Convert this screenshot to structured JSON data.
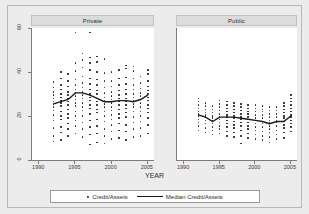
{
  "figure": {
    "background_color": "#ececed",
    "plot_background_color": "#ffffff",
    "marker_color": "#1b1b1b",
    "median_line_color": "#1a1a1a"
  },
  "panels": [
    {
      "title": "Private"
    },
    {
      "title": "Public"
    }
  ],
  "axis": {
    "x_title": "YEAR",
    "y_ticks": [
      "60",
      "40",
      "20",
      "0"
    ],
    "x_ticks_left": [
      "1990",
      "1995",
      "2000",
      "2005"
    ],
    "x_ticks_right": [
      "1990",
      "1995",
      "2000",
      "2005"
    ]
  },
  "legend": {
    "scatter_label": "Credit/Assets",
    "median_label": "Median Credit/Assets"
  },
  "chart_data": {
    "type": "scatter",
    "title": "",
    "xlabel": "YEAR",
    "ylabel": "",
    "xlim": [
      1989,
      2006
    ],
    "ylim": [
      0,
      60
    ],
    "y_ticks": [
      0,
      20,
      40,
      60
    ],
    "x_ticks": [
      1990,
      1995,
      2000,
      2005
    ],
    "grid": false,
    "legend_position": "bottom",
    "panels": [
      {
        "name": "Private",
        "series": [
          {
            "name": "Credit/Assets",
            "type": "scatter",
            "points": [
              {
                "x": 1992,
                "values": [
                  8.5,
                  11.0,
                  14.5,
                  18.0,
                  20.5,
                  22.5,
                  24.0,
                  25.5,
                  26.5,
                  28.0,
                  29.5,
                  31.0,
                  33.0,
                  35.5
                ]
              },
              {
                "x": 1993,
                "values": [
                  9.0,
                  12.5,
                  15.0,
                  18.5,
                  20.0,
                  22.0,
                  24.5,
                  26.0,
                  27.0,
                  28.5,
                  30.0,
                  32.0,
                  34.0,
                  37.0,
                  40.0
                ]
              },
              {
                "x": 1994,
                "values": [
                  11.0,
                  14.0,
                  16.5,
                  19.0,
                  21.0,
                  23.0,
                  25.0,
                  26.5,
                  28.0,
                  29.5,
                  31.0,
                  33.5,
                  36.0,
                  39.0
                ]
              },
              {
                "x": 1995,
                "values": [
                  12.0,
                  15.5,
                  18.0,
                  20.0,
                  22.0,
                  24.5,
                  26.0,
                  27.5,
                  29.0,
                  30.5,
                  32.0,
                  34.0,
                  36.5,
                  40.5,
                  44.0,
                  58.0
                ]
              },
              {
                "x": 1996,
                "values": [
                  10.5,
                  14.0,
                  17.0,
                  20.0,
                  22.5,
                  24.0,
                  26.0,
                  28.0,
                  29.5,
                  31.0,
                  33.0,
                  35.0,
                  38.0,
                  42.0,
                  45.5,
                  48.5
                ]
              },
              {
                "x": 1997,
                "values": [
                  7.0,
                  11.5,
                  15.0,
                  18.0,
                  21.0,
                  23.5,
                  25.0,
                  27.0,
                  28.5,
                  30.0,
                  32.0,
                  34.5,
                  37.0,
                  41.0,
                  44.0,
                  46.5,
                  58.0
                ]
              },
              {
                "x": 1998,
                "values": [
                  8.0,
                  12.0,
                  15.5,
                  18.5,
                  21.5,
                  23.0,
                  25.0,
                  26.5,
                  28.0,
                  30.0,
                  31.5,
                  34.0,
                  36.5,
                  40.0,
                  44.5,
                  47.0
                ]
              },
              {
                "x": 1999,
                "values": [
                  7.5,
                  11.0,
                  14.0,
                  17.5,
                  20.0,
                  22.0,
                  24.0,
                  25.5,
                  27.0,
                  28.5,
                  30.5,
                  33.0,
                  36.0,
                  39.5,
                  46.0
                ]
              },
              {
                "x": 2000,
                "values": [
                  9.5,
                  13.0,
                  16.0,
                  18.5,
                  20.5,
                  22.5,
                  24.0,
                  26.0,
                  27.5,
                  29.0,
                  31.0,
                  33.5,
                  36.0,
                  40.0
                ]
              },
              {
                "x": 2001,
                "values": [
                  10.0,
                  13.5,
                  16.5,
                  19.0,
                  21.0,
                  23.0,
                  25.0,
                  26.5,
                  28.0,
                  29.5,
                  31.5,
                  34.0,
                  37.0,
                  41.0
                ]
              },
              {
                "x": 2002,
                "values": [
                  9.0,
                  13.0,
                  16.0,
                  19.5,
                  21.5,
                  23.5,
                  25.0,
                  26.5,
                  28.0,
                  30.0,
                  32.0,
                  34.5,
                  37.5,
                  41.5,
                  43.0
                ]
              },
              {
                "x": 2003,
                "values": [
                  10.5,
                  14.0,
                  17.0,
                  19.5,
                  22.0,
                  24.0,
                  25.5,
                  27.0,
                  28.5,
                  30.0,
                  32.0,
                  34.0,
                  37.0,
                  40.5,
                  42.5
                ]
              },
              {
                "x": 2004,
                "values": [
                  11.0,
                  14.5,
                  17.5,
                  20.0,
                  22.0,
                  24.0,
                  26.0,
                  27.5,
                  29.0,
                  30.5,
                  32.5,
                  35.0,
                  38.0
                ]
              },
              {
                "x": 2005,
                "values": [
                  12.0,
                  16.0,
                  19.0,
                  21.5,
                  23.5,
                  25.0,
                  27.0,
                  28.5,
                  30.0,
                  31.5,
                  33.5,
                  36.0,
                  39.0,
                  41.0
                ]
              }
            ]
          },
          {
            "name": "Median Credit/Assets",
            "type": "line",
            "x": [
              1992,
              1993,
              1994,
              1995,
              1996,
              1997,
              1998,
              1999,
              2000,
              2001,
              2002,
              2003,
              2004,
              2005
            ],
            "values": [
              25.5,
              26.5,
              27.5,
              30.5,
              30.5,
              29.5,
              28.0,
              26.5,
              26.5,
              27.0,
              27.0,
              26.5,
              27.5,
              29.5
            ]
          }
        ]
      },
      {
        "name": "Public",
        "series": [
          {
            "name": "Credit/Assets",
            "type": "scatter",
            "points": [
              {
                "x": 1992,
                "values": [
                  13.5,
                  15.5,
                  17.0,
                  18.5,
                  20.0,
                  21.0,
                  22.0,
                  23.5,
                  25.0,
                  26.5,
                  28.0
                ]
              },
              {
                "x": 1993,
                "values": [
                  12.5,
                  14.5,
                  16.5,
                  18.0,
                  19.5,
                  20.5,
                  21.5,
                  23.0,
                  24.5,
                  26.0
                ]
              },
              {
                "x": 1994,
                "values": [
                  11.5,
                  13.5,
                  15.0,
                  16.5,
                  18.0,
                  19.0,
                  20.0,
                  21.5,
                  23.0,
                  24.5
                ]
              },
              {
                "x": 1995,
                "values": [
                  12.0,
                  14.0,
                  15.5,
                  17.0,
                  18.5,
                  19.5,
                  21.0,
                  22.5,
                  24.0,
                  25.5,
                  27.0
                ]
              },
              {
                "x": 1996,
                "values": [
                  11.0,
                  13.0,
                  15.0,
                  16.5,
                  18.0,
                  19.5,
                  20.5,
                  22.0,
                  23.5,
                  25.0,
                  26.5
                ]
              },
              {
                "x": 1997,
                "values": [
                  10.5,
                  12.5,
                  14.5,
                  16.0,
                  17.5,
                  19.0,
                  20.0,
                  21.5,
                  23.0,
                  24.5,
                  26.0
                ]
              },
              {
                "x": 1998,
                "values": [
                  7.5,
                  11.0,
                  13.5,
                  15.5,
                  17.0,
                  18.5,
                  19.5,
                  21.0,
                  22.5,
                  24.0,
                  25.5
                ]
              },
              {
                "x": 1999,
                "values": [
                  10.0,
                  12.0,
                  14.0,
                  15.5,
                  17.0,
                  18.5,
                  19.5,
                  21.0,
                  22.0,
                  23.5,
                  25.0
                ]
              },
              {
                "x": 2000,
                "values": [
                  9.5,
                  11.5,
                  13.5,
                  15.0,
                  16.5,
                  18.0,
                  19.0,
                  20.5,
                  22.0,
                  23.5,
                  25.0
                ]
              },
              {
                "x": 2001,
                "values": [
                  9.0,
                  11.0,
                  13.0,
                  15.0,
                  16.5,
                  17.5,
                  19.0,
                  20.5,
                  22.0,
                  23.0,
                  24.5
                ]
              },
              {
                "x": 2002,
                "values": [
                  8.0,
                  10.5,
                  12.5,
                  14.0,
                  15.5,
                  17.0,
                  18.0,
                  19.5,
                  21.0,
                  22.5,
                  24.0
                ]
              },
              {
                "x": 2003,
                "values": [
                  9.5,
                  11.5,
                  13.5,
                  15.5,
                  17.0,
                  18.0,
                  19.5,
                  21.0,
                  22.5,
                  24.0
                ]
              },
              {
                "x": 2004,
                "values": [
                  10.0,
                  12.5,
                  14.5,
                  16.0,
                  17.5,
                  19.0,
                  20.0,
                  21.5,
                  23.0,
                  24.5,
                  26.0
                ]
              },
              {
                "x": 2005,
                "values": [
                  13.0,
                  15.0,
                  16.5,
                  18.0,
                  19.5,
                  20.5,
                  22.0,
                  23.5,
                  25.0,
                  26.5,
                  28.0,
                  29.5
                ]
              }
            ]
          },
          {
            "name": "Median Credit/Assets",
            "type": "line",
            "x": [
              1992,
              1993,
              1994,
              1995,
              1996,
              1997,
              1998,
              1999,
              2000,
              2001,
              2002,
              2003,
              2004,
              2005
            ],
            "values": [
              20.5,
              19.5,
              17.5,
              19.5,
              19.5,
              19.5,
              19.0,
              18.5,
              18.0,
              17.5,
              16.5,
              17.5,
              17.5,
              20.0
            ]
          }
        ]
      }
    ]
  }
}
